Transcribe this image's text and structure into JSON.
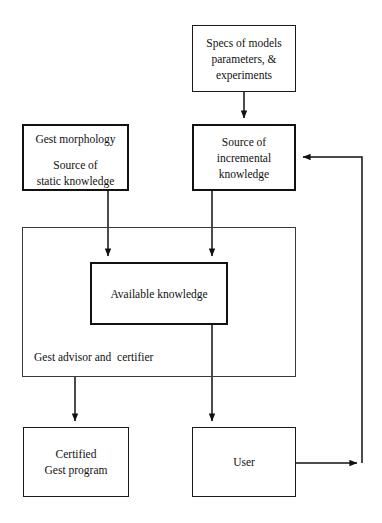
{
  "diagram": {
    "type": "flowchart",
    "nodes": [
      {
        "id": "specs",
        "name": "specs-of-models-box",
        "lines": [
          "Specs of models",
          "parameters, &",
          "experiments"
        ],
        "border": "thin"
      },
      {
        "id": "static",
        "name": "source-of-static-knowledge-box",
        "lines": [
          "Gest morphology",
          "Source of",
          "static knowledge"
        ],
        "border": "thick"
      },
      {
        "id": "incremental",
        "name": "source-of-incremental-knowledge-box",
        "lines": [
          "Source of",
          "incremental",
          "knowledge"
        ],
        "border": "thick"
      },
      {
        "id": "container",
        "name": "gest-advisor-and-certifier-container",
        "label": "Gest advisor and  certifier",
        "border": "thin"
      },
      {
        "id": "available",
        "name": "available-knowledge-box",
        "lines": [
          "Available knowledge"
        ],
        "border": "thick"
      },
      {
        "id": "certified",
        "name": "certified-gest-program-box",
        "lines": [
          "Certified",
          "Gest program"
        ],
        "border": "thin"
      },
      {
        "id": "user",
        "name": "user-box",
        "lines": [
          "User"
        ],
        "border": "thin"
      }
    ],
    "edges": [
      {
        "from": "specs",
        "to": "incremental",
        "name": "edge-specs-to-incremental"
      },
      {
        "from": "static",
        "to": "available",
        "name": "edge-static-to-available"
      },
      {
        "from": "incremental",
        "to": "available",
        "name": "edge-incremental-to-available"
      },
      {
        "from": "container",
        "to": "certified",
        "name": "edge-container-to-certified"
      },
      {
        "from": "available",
        "to": "user",
        "name": "edge-available-to-user"
      },
      {
        "from": "user",
        "to": "incremental",
        "name": "edge-user-feedback-to-incremental"
      }
    ],
    "colors": {
      "stroke": "#111111",
      "background": "#ffffff",
      "text": "#111111",
      "container_stroke": "#3a3a3a"
    }
  }
}
